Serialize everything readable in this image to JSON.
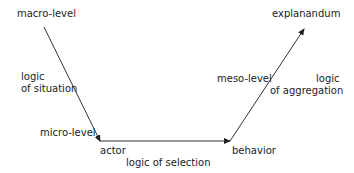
{
  "diagram": {
    "title": "",
    "labels": {
      "macro_level": "macro-level",
      "logic_situation_1": "logic",
      "logic_situation_2": "of situation",
      "micro_level": "micro-level",
      "actor": "actor",
      "logic_selection": "logic of selection",
      "behavior": "behavior",
      "meso_level": "meso-level",
      "logic_aggregation_1": "logic",
      "logic_aggregation_2": "of aggregation",
      "explanandum": "explanandum"
    },
    "edges": [
      {
        "from": "macro-level",
        "to": "actor",
        "label": "logic of situation"
      },
      {
        "from": "actor",
        "to": "behavior",
        "label": "logic of selection"
      },
      {
        "from": "behavior",
        "to": "explanandum",
        "label": "logic of aggregation"
      }
    ],
    "line_color": "#333333"
  }
}
